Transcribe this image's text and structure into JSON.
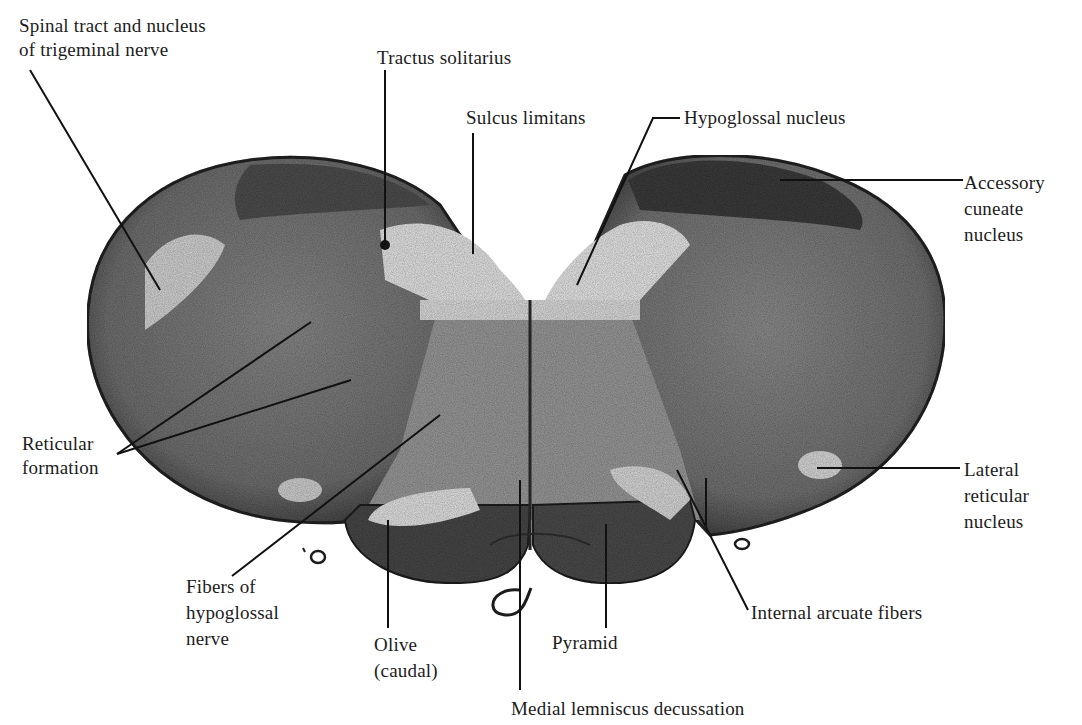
{
  "figure": {
    "colors": {
      "background": "#ffffff",
      "tissue_dark": "#3a3a3a",
      "tissue_mid": "#7d7d7d",
      "tissue_light": "#d9d9d9",
      "leader": "#111111"
    }
  },
  "labels": {
    "spinal_trigeminal": "Spinal tract and nucleus\nof trigeminal nerve",
    "tractus_solitarius": "Tractus solitarius",
    "sulcus_limitans": "Sulcus limitans",
    "hypoglossal_nucleus": "Hypoglossal nucleus",
    "accessory_cuneate": "Accessory\ncuneate\nnucleus",
    "reticular_formation": "Reticular\nformation",
    "lateral_reticular": "Lateral\nreticular\nnucleus",
    "fibers_hypoglossal": "Fibers of\nhypoglossal\nnerve",
    "olive": "Olive\n(caudal)",
    "pyramid": "Pyramid",
    "internal_arcuate": "Internal arcuate fibers",
    "medial_lemniscus": "Medial lemniscus decussation"
  }
}
